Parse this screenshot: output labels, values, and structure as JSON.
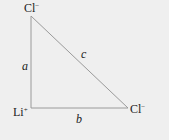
{
  "diagram": {
    "type": "right-triangle",
    "vertices": {
      "top": {
        "ion": "Cl",
        "charge": "−"
      },
      "right_angle": {
        "ion": "Li",
        "charge": "+"
      },
      "right": {
        "ion": "Cl",
        "charge": "−"
      }
    },
    "sides": {
      "vertical": "a",
      "horizontal": "b",
      "hypotenuse": "c"
    },
    "colors": {
      "background": "#efefef",
      "line": "#9a9a9a",
      "text": "#222222"
    }
  }
}
